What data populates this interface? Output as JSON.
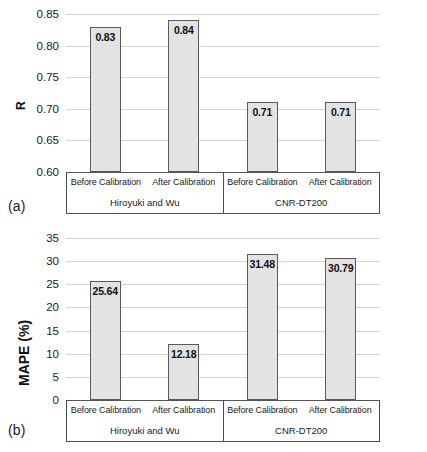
{
  "figure": {
    "panel_a_letter": "(a)",
    "panel_b_letter": "(b)"
  },
  "groups": [
    {
      "name": "Hiroyuki and Wu",
      "conditions": [
        "Before Calibration",
        "After Calibration"
      ]
    },
    {
      "name": "CNR-DT200",
      "conditions": [
        "Before Calibration",
        "After Calibration"
      ]
    }
  ],
  "style": {
    "bar_fill": "#e3e3e3",
    "bar_border": "#5a5a5a",
    "gridline": "#d4d4d4",
    "axis": "#555555",
    "text": "#1a1a1a"
  },
  "chart_data": [
    {
      "type": "bar",
      "panel": "(a)",
      "title": "",
      "xlabel": "",
      "ylabel": "R",
      "ylim": [
        0.6,
        0.85
      ],
      "yticks": [
        0.6,
        0.65,
        0.7,
        0.75,
        0.8,
        0.85
      ],
      "ytick_labels": [
        "0.60",
        "0.65",
        "0.70",
        "0.75",
        "0.80",
        "0.85"
      ],
      "grid": true,
      "legend": "none",
      "categories": [
        "Hiroyuki and Wu - Before Calibration",
        "Hiroyuki and Wu - After Calibration",
        "CNR-DT200 - Before Calibration",
        "CNR-DT200 - After Calibration"
      ],
      "values": [
        0.83,
        0.84,
        0.71,
        0.71
      ],
      "value_labels": [
        "0.83",
        "0.84",
        "0.71",
        "0.71"
      ]
    },
    {
      "type": "bar",
      "panel": "(b)",
      "title": "",
      "xlabel": "",
      "ylabel": "MAPE (%)",
      "ylim": [
        0,
        35
      ],
      "yticks": [
        0,
        5,
        10,
        15,
        20,
        25,
        30,
        35
      ],
      "ytick_labels": [
        "0",
        "5",
        "10",
        "15",
        "20",
        "25",
        "30",
        "35"
      ],
      "grid": true,
      "legend": "none",
      "categories": [
        "Hiroyuki and Wu - Before Calibration",
        "Hiroyuki and Wu - After Calibration",
        "CNR-DT200 - Before Calibration",
        "CNR-DT200 - After Calibration"
      ],
      "values": [
        25.64,
        12.18,
        31.48,
        30.79
      ],
      "value_labels": [
        "25.64",
        "12.18",
        "31.48",
        "30.79"
      ]
    }
  ]
}
